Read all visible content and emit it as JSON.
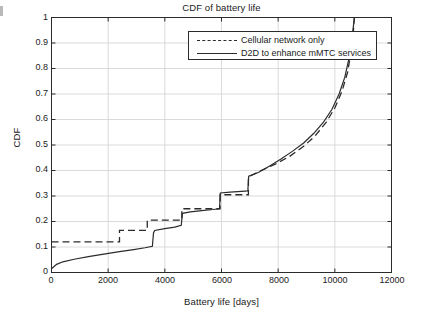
{
  "chart_data": {
    "type": "line",
    "title": "CDF of battery life",
    "xlabel": "Battery life [days]",
    "ylabel": "CDF",
    "xlim": [
      0,
      12000
    ],
    "ylim": [
      0,
      1
    ],
    "xticks": [
      0,
      2000,
      4000,
      6000,
      8000,
      10000,
      12000
    ],
    "xtick_labels": [
      "0",
      "2000",
      "4000",
      "6000",
      "8000",
      "10000",
      "12000"
    ],
    "yticks": [
      0,
      0.1,
      0.2,
      0.3,
      0.4,
      0.5,
      0.6,
      0.7,
      0.8,
      0.9,
      1
    ],
    "ytick_labels": [
      "0",
      "0.1",
      "0.2",
      "0.3",
      "0.4",
      "0.5",
      "0.6",
      "0.7",
      "0.8",
      "0.9",
      "1"
    ],
    "grid": true,
    "legend_position": "top-center",
    "series": [
      {
        "name": "Cellular network only",
        "style": "dashed",
        "color": "#2b2b2b",
        "points": [
          [
            0,
            0.12
          ],
          [
            2400,
            0.12
          ],
          [
            2400,
            0.165
          ],
          [
            3380,
            0.165
          ],
          [
            3380,
            0.205
          ],
          [
            4600,
            0.205
          ],
          [
            4600,
            0.25
          ],
          [
            5950,
            0.25
          ],
          [
            5950,
            0.305
          ],
          [
            6950,
            0.305
          ],
          [
            6950,
            0.375
          ],
          [
            7400,
            0.4
          ],
          [
            7900,
            0.425
          ],
          [
            8400,
            0.455
          ],
          [
            8900,
            0.495
          ],
          [
            9300,
            0.535
          ],
          [
            9700,
            0.59
          ],
          [
            10000,
            0.645
          ],
          [
            10250,
            0.71
          ],
          [
            10450,
            0.785
          ],
          [
            10580,
            0.87
          ],
          [
            10650,
            0.94
          ],
          [
            10690,
            1.0
          ]
        ]
      },
      {
        "name": "D2D to enhance mMTC services",
        "style": "solid",
        "color": "#2b2b2b",
        "points": [
          [
            0,
            0.015
          ],
          [
            180,
            0.032
          ],
          [
            400,
            0.042
          ],
          [
            800,
            0.052
          ],
          [
            1300,
            0.062
          ],
          [
            1900,
            0.073
          ],
          [
            2400,
            0.082
          ],
          [
            2900,
            0.09
          ],
          [
            3300,
            0.097
          ],
          [
            3560,
            0.103
          ],
          [
            3600,
            0.155
          ],
          [
            3640,
            0.165
          ],
          [
            4000,
            0.172
          ],
          [
            4350,
            0.178
          ],
          [
            4580,
            0.185
          ],
          [
            4620,
            0.232
          ],
          [
            4900,
            0.238
          ],
          [
            5300,
            0.243
          ],
          [
            5700,
            0.247
          ],
          [
            5930,
            0.25
          ],
          [
            5960,
            0.312
          ],
          [
            6300,
            0.315
          ],
          [
            6700,
            0.318
          ],
          [
            6930,
            0.32
          ],
          [
            6960,
            0.378
          ],
          [
            7300,
            0.392
          ],
          [
            7700,
            0.418
          ],
          [
            8100,
            0.445
          ],
          [
            8500,
            0.475
          ],
          [
            8900,
            0.508
          ],
          [
            9250,
            0.545
          ],
          [
            9600,
            0.59
          ],
          [
            9900,
            0.64
          ],
          [
            10150,
            0.7
          ],
          [
            10350,
            0.765
          ],
          [
            10500,
            0.84
          ],
          [
            10600,
            0.915
          ],
          [
            10660,
            0.97
          ],
          [
            10690,
            1.0
          ]
        ]
      }
    ]
  }
}
